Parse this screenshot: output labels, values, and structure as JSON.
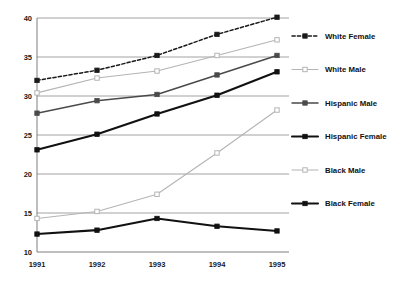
{
  "chart_data": {
    "type": "line",
    "title": "",
    "xlabel": "",
    "ylabel": "",
    "categories": [
      "1991",
      "1992",
      "1993",
      "1994",
      "1995"
    ],
    "x_tick_labels": [
      "1991",
      "1992",
      "1993",
      "1994",
      "1995"
    ],
    "y_tick_labels": [
      "10",
      "15",
      "20",
      "25",
      "30",
      "35",
      "40"
    ],
    "y_ticks": [
      10,
      15,
      20,
      25,
      30,
      35,
      40
    ],
    "ylim": [
      10,
      40
    ],
    "grid": "horizontal",
    "legend_position": "right",
    "series": [
      {
        "name": "White Female",
        "values": [
          32.0,
          33.3,
          35.2,
          37.9,
          40.1
        ],
        "color": "#1a1a1a",
        "line_style": "dashed",
        "marker": "filled-square",
        "line_width": 1.5
      },
      {
        "name": "White Male",
        "values": [
          30.4,
          32.3,
          33.2,
          35.2,
          37.2
        ],
        "color": "#b4b4b4",
        "line_style": "solid",
        "marker": "open-square",
        "line_width": 1.1
      },
      {
        "name": "Hispanic Male",
        "values": [
          27.8,
          29.4,
          30.2,
          32.7,
          35.2
        ],
        "color": "#4a4a4a",
        "line_style": "solid",
        "marker": "filled-square",
        "line_width": 1.5
      },
      {
        "name": "Hispanic Female",
        "values": [
          23.1,
          25.1,
          27.7,
          30.1,
          33.1
        ],
        "color": "#111111",
        "line_style": "solid",
        "marker": "filled-square",
        "line_width": 2.1
      },
      {
        "name": "Black Male",
        "values": [
          14.3,
          15.2,
          17.4,
          22.7,
          28.2
        ],
        "color": "#b4b4b4",
        "line_style": "solid",
        "marker": "open-square",
        "line_width": 1.1
      },
      {
        "name": "Black Female",
        "values": [
          12.3,
          12.8,
          14.3,
          13.3,
          12.7
        ],
        "color": "#111111",
        "line_style": "solid",
        "marker": "filled-square",
        "line_width": 2.1
      }
    ]
  }
}
